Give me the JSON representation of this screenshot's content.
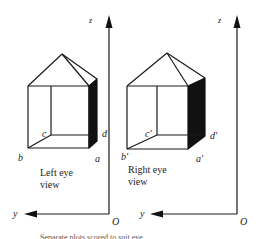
{
  "figure": {
    "left_view": {
      "label_line1": "Left eye",
      "label_line2": "view",
      "vertices": {
        "a": "a",
        "b": "b",
        "c": "c",
        "d": "d"
      },
      "axes": {
        "z": "z",
        "y": "y",
        "origin": "O"
      }
    },
    "right_view": {
      "label_line1": "Right eye",
      "label_line2": "view",
      "vertices": {
        "a": "a'",
        "b": "b'",
        "c": "c'",
        "d": "d'"
      },
      "axes": {
        "z": "z",
        "y": "y",
        "origin": "O"
      }
    },
    "caption": "Separate plots scored to suit eye",
    "colors": {
      "line": "#1a1a1a",
      "shade": "#111111",
      "background": "#ffffff"
    }
  }
}
